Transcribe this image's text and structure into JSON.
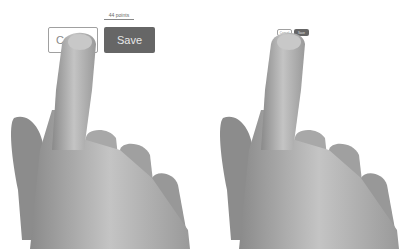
{
  "left_panel": {
    "measure_label": "44 points",
    "cancel_label": "Cancel",
    "save_label": "Save"
  },
  "right_panel": {
    "cancel_label": "Cancel",
    "save_label": "Save"
  },
  "colors": {
    "save_bg": "#666666",
    "cancel_border": "#a0a0a0",
    "skin": "#b0b0b0"
  }
}
